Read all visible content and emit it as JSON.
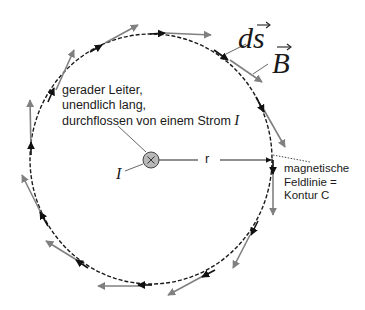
{
  "diagram": {
    "labels": {
      "ds": "ds",
      "B": "B",
      "conductor_line1": "gerader Leiter,",
      "conductor_line2": "unendlich lang,",
      "conductor_line3": "durchflossen von einem Strom",
      "current_symbol": "I",
      "current_label": "I",
      "radius": "r",
      "fieldline_line1": "magnetische",
      "fieldline_line2": "Feldlinie =",
      "fieldline_line3": "Kontur C"
    },
    "colors": {
      "circle": "#1a1a1a",
      "ds_arrow": "#111111",
      "B_arrow": "#808080",
      "conductor_fill": "#b8b8b8"
    },
    "icons": {
      "conductor": "circle-cross-icon"
    }
  }
}
